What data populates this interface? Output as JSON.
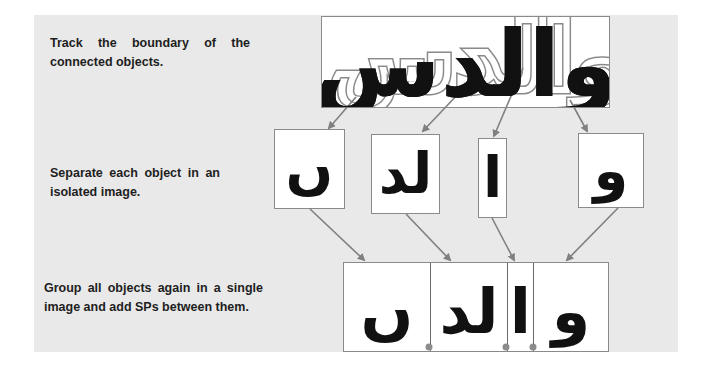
{
  "steps": [
    {
      "id": "track",
      "caption": "Track the boundary of the connected objects."
    },
    {
      "id": "separate",
      "caption": "Separate each object in an isolated image."
    },
    {
      "id": "group",
      "caption": "Group all objects again in a single image and add SPs between them."
    }
  ],
  "source_word": {
    "text": "والدس",
    "boundary_style": "dashed outline around each connected component"
  },
  "isolated_objects": [
    {
      "label": "seen",
      "glyph": "ں"
    },
    {
      "label": "lam-dal",
      "glyph": "لد"
    },
    {
      "label": "alif",
      "glyph": "ا"
    },
    {
      "label": "waw",
      "glyph": "و"
    }
  ],
  "grouped_segments": [
    {
      "label": "seen",
      "glyph": "ں"
    },
    {
      "label": "lam-dal",
      "glyph": "لد"
    },
    {
      "label": "alif",
      "glyph": "ا"
    },
    {
      "label": "waw",
      "glyph": "و"
    }
  ],
  "separator_points": {
    "label": "SPs",
    "count": 3
  },
  "colors": {
    "panel_background": "#e9e9e9",
    "arrow": "#808080",
    "box_border": "#8a8a8a",
    "ink": "#111111",
    "separator_dot": "#8c8c8c"
  }
}
